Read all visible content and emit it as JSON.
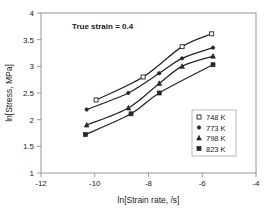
{
  "chart_data": {
    "type": "line",
    "title": "",
    "annotation": "True strain = 0.4",
    "xlabel": "ln[Strain rate, /s]",
    "ylabel": "ln[Stress, MPa]",
    "xlim": [
      -12,
      -4
    ],
    "ylim": [
      1,
      4
    ],
    "xticks": [
      -12,
      -10,
      -8,
      -6,
      -4
    ],
    "xtick_labels": [
      "-12",
      "-10",
      "-8",
      "-6",
      "-4"
    ],
    "yticks": [
      1,
      1.5,
      2,
      2.5,
      3,
      3.5,
      4
    ],
    "ytick_labels": [
      "1",
      "1.5",
      "2",
      "2.5",
      "3",
      "3.5",
      "4"
    ],
    "grid": false,
    "legend_position": "lower-right",
    "series": [
      {
        "name": "748 K",
        "marker": "open-square",
        "points": [
          {
            "x": -9.95,
            "y": 2.37
          },
          {
            "x": -8.2,
            "y": 2.8
          },
          {
            "x": -6.75,
            "y": 3.37
          },
          {
            "x": -5.65,
            "y": 3.61
          }
        ]
      },
      {
        "name": "773 K",
        "marker": "dot",
        "points": [
          {
            "x": -10.3,
            "y": 2.19
          },
          {
            "x": -8.75,
            "y": 2.5
          },
          {
            "x": -7.6,
            "y": 2.87
          },
          {
            "x": -6.75,
            "y": 3.15
          },
          {
            "x": -5.6,
            "y": 3.35
          }
        ]
      },
      {
        "name": "798 K",
        "marker": "triangle",
        "points": [
          {
            "x": -10.3,
            "y": 1.9
          },
          {
            "x": -8.75,
            "y": 2.22
          },
          {
            "x": -7.6,
            "y": 2.68
          },
          {
            "x": -6.75,
            "y": 3.0
          },
          {
            "x": -5.6,
            "y": 3.19
          }
        ]
      },
      {
        "name": "823 K",
        "marker": "filled-square",
        "points": [
          {
            "x": -10.35,
            "y": 1.72
          },
          {
            "x": -8.65,
            "y": 2.11
          },
          {
            "x": -7.6,
            "y": 2.5
          },
          {
            "x": -5.6,
            "y": 3.03
          }
        ]
      }
    ]
  },
  "legend": {
    "entries": [
      {
        "label": "748 K",
        "marker": "open-square"
      },
      {
        "label": "773 K",
        "marker": "dot"
      },
      {
        "label": "798 K",
        "marker": "triangle"
      },
      {
        "label": "823 K",
        "marker": "filled-square"
      }
    ]
  },
  "colors": {
    "curve": "#262626",
    "axis": "#8c8c8c",
    "text": "#1a1a1a",
    "background": "#ffffff"
  }
}
